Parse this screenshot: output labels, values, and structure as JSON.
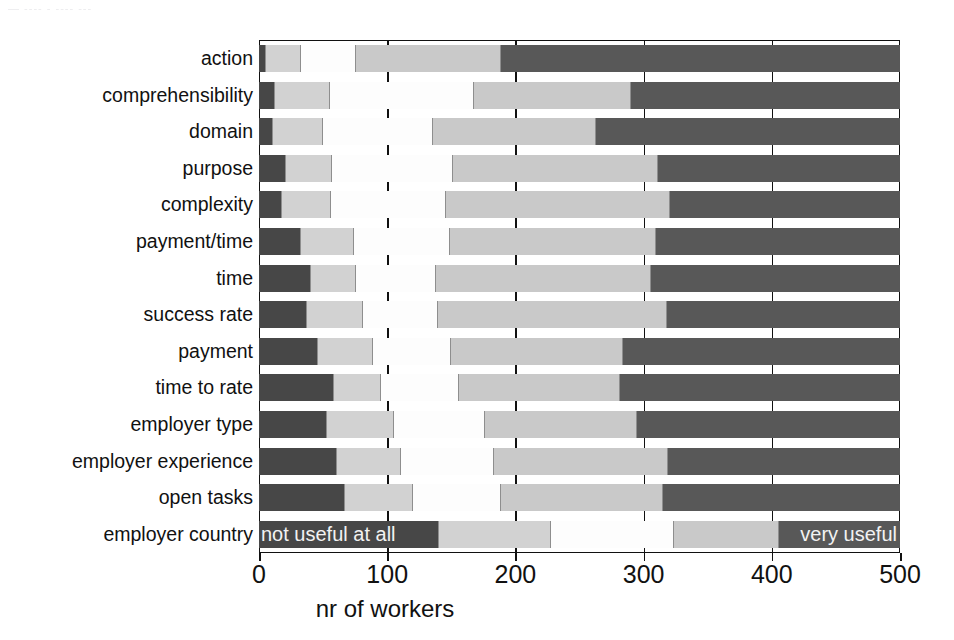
{
  "artifact_text": "— ---- -  ---- ---",
  "chart_data": {
    "type": "bar",
    "orientation": "horizontal",
    "stacked": true,
    "title": "",
    "xlabel": "nr of workers",
    "ylabel": "",
    "xlim": [
      0,
      500
    ],
    "xticks": [
      0,
      100,
      200,
      300,
      400,
      500
    ],
    "xticklabels": [
      "0",
      "100",
      "200",
      "300",
      "400",
      "500"
    ],
    "grid": true,
    "legend_position": "inline-on-last-bar",
    "categories": [
      "action",
      "comprehensibility",
      "domain",
      "purpose",
      "complexity",
      "payment/time",
      "time",
      "success rate",
      "payment",
      "time to rate",
      "employer type",
      "employer experience",
      "open tasks",
      "employer country"
    ],
    "series": [
      {
        "name": "not useful at all",
        "color": "#474747",
        "values": [
          5,
          12,
          10,
          20,
          17,
          32,
          40,
          37,
          45,
          58,
          52,
          60,
          66,
          140
        ]
      },
      {
        "name": "rating 2",
        "color": "#d2d2d2",
        "values": [
          28,
          43,
          40,
          37,
          39,
          42,
          36,
          44,
          44,
          37,
          53,
          51,
          54,
          88
        ]
      },
      {
        "name": "rating 3",
        "color": "#fdfdfd",
        "values": [
          43,
          113,
          86,
          94,
          90,
          75,
          62,
          59,
          61,
          61,
          71,
          72,
          69,
          96
        ]
      },
      {
        "name": "rating 4",
        "color": "#c9c9c9",
        "values": [
          113,
          122,
          127,
          160,
          175,
          161,
          168,
          178,
          134,
          126,
          119,
          136,
          126,
          82
        ]
      },
      {
        "name": "very useful",
        "color": "#585858",
        "values": [
          311,
          210,
          237,
          189,
          179,
          190,
          194,
          182,
          216,
          218,
          205,
          181,
          185,
          94
        ]
      }
    ],
    "inline_labels": {
      "left": "not useful at all",
      "right": "very useful"
    }
  }
}
